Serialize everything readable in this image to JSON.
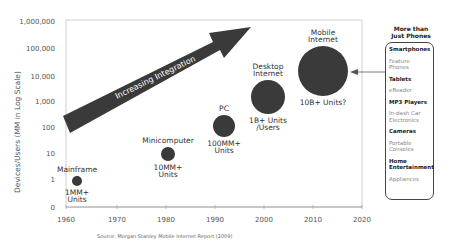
{
  "chart_data": {
    "type": "scatter",
    "subtype": "bubble",
    "title": "",
    "xlabel": "",
    "ylabel": "Devices/Users (MM in Log Scale)",
    "xlim": [
      1960,
      2020
    ],
    "x_ticks": [
      "1960",
      "1970",
      "1980",
      "1990",
      "2000",
      "2010",
      "2020"
    ],
    "y_scale": "log",
    "y_ticks": [
      "0",
      "1",
      "10",
      "100",
      "1,000",
      "10,000",
      "100,000",
      "1,000,000"
    ],
    "grid": false,
    "series": [
      {
        "name": "Mainframe",
        "x": 1962,
        "y": 1,
        "size_label": "1MM+ Units",
        "radius": 5
      },
      {
        "name": "Minicomputer",
        "x": 1978,
        "y": 10,
        "size_label": "10MM+ Units",
        "radius": 7
      },
      {
        "name": "PC",
        "x": 1992,
        "y": 100,
        "size_label": "100MM+ Units",
        "radius": 11
      },
      {
        "name": "Desktop Internet",
        "x": 2001,
        "y": 1000,
        "size_label": "1B+ Units /Users",
        "radius": 17
      },
      {
        "name": "Mobile Internet",
        "x": 2012,
        "y": 10000,
        "size_label": "10B+ Units?",
        "radius": 25
      }
    ],
    "annotations": [
      "Increasing Integration"
    ]
  },
  "chart": {
    "ylabel": "Devices/Users (MM in Log Scale)",
    "arrow_label": "Increasing Integration",
    "y_ticks": [
      {
        "label": "1,000,000",
        "y": 21
      },
      {
        "label": "100,000",
        "y": 48
      },
      {
        "label": "10,000",
        "y": 76
      },
      {
        "label": "1,000",
        "y": 101
      },
      {
        "label": "100",
        "y": 127
      },
      {
        "label": "10",
        "y": 153
      },
      {
        "label": "1",
        "y": 179
      },
      {
        "label": "0",
        "y": 207
      }
    ],
    "x_ticks": [
      {
        "label": "1960",
        "x": 66
      },
      {
        "label": "1970",
        "x": 117
      },
      {
        "label": "1980",
        "x": 166
      },
      {
        "label": "1990",
        "x": 215
      },
      {
        "label": "2000",
        "x": 264
      },
      {
        "label": "2010",
        "x": 313
      },
      {
        "label": "2020",
        "x": 362
      }
    ],
    "bubbles": [
      {
        "name": "Mainframe",
        "name2": "",
        "cx": 77,
        "cy": 181,
        "r": 5,
        "units1": "1MM+",
        "units2": "Units"
      },
      {
        "name": "Minicomputer",
        "name2": "",
        "cx": 168,
        "cy": 154,
        "r": 7,
        "units1": "10MM+",
        "units2": "Units"
      },
      {
        "name": "PC",
        "name2": "",
        "cx": 224,
        "cy": 126,
        "r": 11,
        "units1": "100MM+",
        "units2": "Units"
      },
      {
        "name": "Desktop",
        "name2": "Internet",
        "cx": 268,
        "cy": 97,
        "r": 17,
        "units1": "1B+ Units",
        "units2": "/Users"
      },
      {
        "name": "Mobile",
        "name2": "Internet",
        "cx": 323,
        "cy": 71,
        "r": 25,
        "units1": "10B+ Units?",
        "units2": ""
      }
    ],
    "colors": {
      "bubble": "#3a3a3a",
      "arrow": "#3a3a3a",
      "axis": "#999999"
    }
  },
  "sidebar": {
    "heading": "More than\nJust Phones",
    "items": [
      {
        "label": "Smartphones",
        "style": "bold"
      },
      {
        "label": "Feature\nPhones",
        "style": "light"
      },
      {
        "label": "Tablets",
        "style": "bold"
      },
      {
        "label": "eReader",
        "style": "light"
      },
      {
        "label": "MP3 Players",
        "style": "bold"
      },
      {
        "label": "In-dash Car\nElectronics",
        "style": "light"
      },
      {
        "label": "Cameras",
        "style": "bold"
      },
      {
        "label": "Portable\nConsoles",
        "style": "light"
      },
      {
        "label": "Home\nEntertainment",
        "style": "bold"
      },
      {
        "label": "Appliances",
        "style": "light"
      }
    ]
  },
  "source": "Source: Morgan Stanley Mobile Internet Report (2009)"
}
